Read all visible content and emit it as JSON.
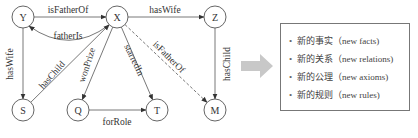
{
  "graph": {
    "nodes": [
      {
        "id": "Y",
        "label": "Y"
      },
      {
        "id": "X",
        "label": "X"
      },
      {
        "id": "Z",
        "label": "Z"
      },
      {
        "id": "S",
        "label": "S"
      },
      {
        "id": "Q",
        "label": "Q"
      },
      {
        "id": "T",
        "label": "T"
      },
      {
        "id": "M",
        "label": "M"
      }
    ],
    "edges": [
      {
        "from": "Y",
        "to": "X",
        "label": "isFatherOf",
        "style": "solid"
      },
      {
        "from": "X",
        "to": "Y",
        "label": "fatherIs",
        "style": "solid",
        "curved": true
      },
      {
        "from": "X",
        "to": "Z",
        "label": "hasWife",
        "style": "solid"
      },
      {
        "from": "Y",
        "to": "S",
        "label": "hasWife",
        "style": "solid"
      },
      {
        "from": "S",
        "to": "X",
        "label": "hasChild",
        "style": "solid"
      },
      {
        "from": "X",
        "to": "Q",
        "label": "wonPrize",
        "style": "solid"
      },
      {
        "from": "X",
        "to": "T",
        "label": "starredIn",
        "style": "solid"
      },
      {
        "from": "X",
        "to": "M",
        "label": "isFatherOf",
        "style": "dashed"
      },
      {
        "from": "Z",
        "to": "M",
        "label": "hasChild",
        "style": "solid"
      },
      {
        "from": "Q",
        "to": "T",
        "label": "forRole",
        "style": "solid"
      }
    ]
  },
  "arrow": {
    "icon": "right-arrow-icon",
    "color": "#c8c8c8"
  },
  "results": {
    "bullet": "•",
    "items": [
      {
        "label": "新的事实（new facts)"
      },
      {
        "label": "新的关系（new relations)"
      },
      {
        "label": "新的公理（new axioms)"
      },
      {
        "label": "新的规则（new rules)"
      }
    ]
  }
}
